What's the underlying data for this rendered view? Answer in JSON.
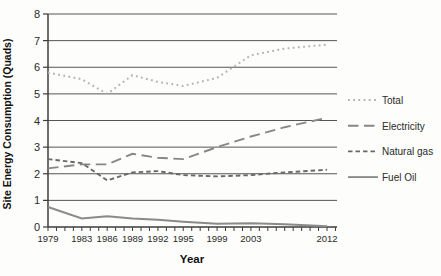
{
  "chart_data": {
    "type": "line",
    "title": "",
    "xlabel": "Year",
    "ylabel": "Site Energy Consumption (Quads)",
    "ylim": [
      0,
      8
    ],
    "yticks": [
      0,
      1,
      2,
      3,
      4,
      5,
      6,
      7,
      8
    ],
    "xlim": [
      1979,
      2013
    ],
    "xtick_labels": [
      "1979",
      "1983",
      "1986",
      "1989",
      "1992",
      "1995",
      "1999",
      "2003",
      "2012"
    ],
    "minor_x_ticks": "every year 1979-2013",
    "grid": "horizontal",
    "legend_position": "right",
    "axis_color": "#3c3c3c",
    "grid_color": "#555555",
    "tick_label_color": "#333333",
    "x": [
      1979,
      1983,
      1986,
      1989,
      1992,
      1995,
      1999,
      2003,
      2007,
      2012
    ],
    "series": [
      {
        "name": "Total",
        "style": "dotted",
        "color": "#b2b2b2",
        "values": [
          5.8,
          5.55,
          5.0,
          5.7,
          5.45,
          5.3,
          5.6,
          6.45,
          6.7,
          6.85
        ]
      },
      {
        "name": "Electricity",
        "style": "long-dash",
        "color": "#878787",
        "values": [
          2.2,
          2.35,
          2.35,
          2.75,
          2.6,
          2.55,
          3.0,
          3.4,
          3.75,
          4.1
        ]
      },
      {
        "name": "Natural gas",
        "style": "short-dash",
        "color": "#696969",
        "values": [
          2.55,
          2.4,
          1.75,
          2.05,
          2.1,
          1.95,
          1.9,
          1.95,
          2.05,
          2.15
        ]
      },
      {
        "name": "Fuel Oil",
        "style": "solid",
        "color": "#8a8a8a",
        "values": [
          0.75,
          0.32,
          0.4,
          0.32,
          0.27,
          0.2,
          0.12,
          0.14,
          0.1,
          0.03
        ]
      }
    ]
  }
}
